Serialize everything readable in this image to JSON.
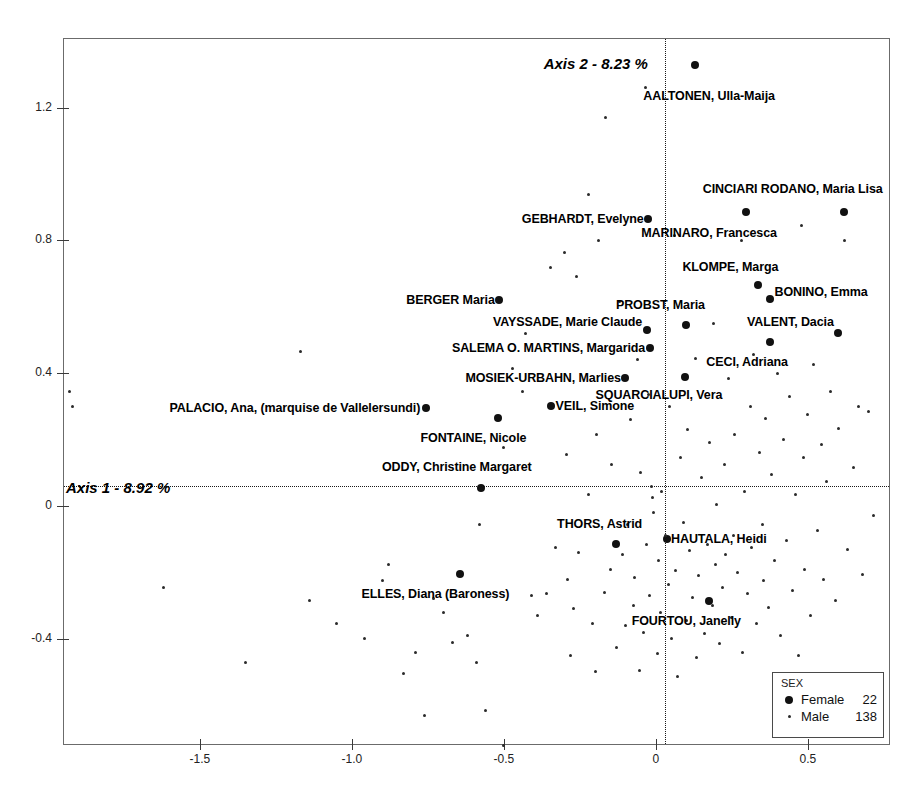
{
  "chart_data": {
    "type": "scatter",
    "title": "",
    "xlabel": "Axis 1 - 8.92 %",
    "ylabel": "Axis 2 - 8.23 %",
    "xlim": [
      -1.95,
      0.77
    ],
    "ylim": [
      -0.72,
      1.41
    ],
    "grid": false,
    "reference_lines": {
      "x": 0,
      "y": 0,
      "style": "dotted"
    },
    "xticks": [
      "-1.5",
      "-1.0",
      "-0.5",
      "0",
      "0.5"
    ],
    "xtick_values": [
      -1.5,
      -1.0,
      -0.5,
      0,
      0.5
    ],
    "yticks": [
      "1.2",
      "0.8",
      "0.4",
      "0",
      "-0.4"
    ],
    "ytick_values": [
      1.2,
      0.8,
      0.4,
      0,
      -0.4
    ],
    "legend": {
      "position": "bottom-right",
      "title": "SEX",
      "entries": [
        {
          "label": "Female",
          "count": "22",
          "marker": "large-dot"
        },
        {
          "label": "Male",
          "count": "138",
          "marker": "small-dot"
        }
      ]
    },
    "series": [
      {
        "name": "Female",
        "marker": "large-dot",
        "points": [
          {
            "label": "AALTONEN, Ulla-Maija",
            "x": 0.13,
            "y": 1.33,
            "anchor": "below",
            "lx": 0.175,
            "ly": 1.255
          },
          {
            "label": "CINCIARI RODANO, Maria Lisa",
            "x": 0.62,
            "y": 0.885,
            "anchor": "above",
            "lx": 0.45,
            "ly": 0.935
          },
          {
            "label": "MARINARO, Francesca",
            "x": 0.295,
            "y": 0.885,
            "anchor": "below",
            "lx": 0.175,
            "ly": 0.845
          },
          {
            "label": "GEBHARDT, Evelyne",
            "x": -0.025,
            "y": 0.865,
            "anchor": "left",
            "lx": -0.04,
            "ly": 0.865
          },
          {
            "label": "KLOMPE, Marga",
            "x": 0.335,
            "y": 0.665,
            "anchor": "above",
            "lx": 0.245,
            "ly": 0.7
          },
          {
            "label": "BONINO, Emma",
            "x": 0.375,
            "y": 0.625,
            "anchor": "right",
            "lx": 0.39,
            "ly": 0.645
          },
          {
            "label": "BERGER Maria",
            "x": -0.515,
            "y": 0.62,
            "anchor": "left",
            "lx": -0.53,
            "ly": 0.62
          },
          {
            "label": "PROBST, Maria",
            "x": 0.1,
            "y": 0.545,
            "anchor": "above",
            "lx": 0.015,
            "ly": 0.585
          },
          {
            "label": "VAYSSADE, Marie Claude",
            "x": -0.03,
            "y": 0.53,
            "anchor": "left",
            "lx": -0.045,
            "ly": 0.555
          },
          {
            "label": "VALENT, Dacia",
            "x": 0.6,
            "y": 0.52,
            "anchor": "left",
            "lx": 0.585,
            "ly": 0.555
          },
          {
            "label": "CECI, Adriana",
            "x": 0.375,
            "y": 0.495,
            "anchor": "below",
            "lx": 0.3,
            "ly": 0.455
          },
          {
            "label": "SALEMA O. MARTINS, Margarida",
            "x": -0.02,
            "y": 0.475,
            "anchor": "left",
            "lx": -0.035,
            "ly": 0.475
          },
          {
            "label": "SQUARCIALUPI, Vera",
            "x": 0.095,
            "y": 0.39,
            "anchor": "below",
            "lx": 0.01,
            "ly": 0.355
          },
          {
            "label": "MOSIEK-URBAHN, Marlies",
            "x": -0.1,
            "y": 0.385,
            "anchor": "left",
            "lx": -0.115,
            "ly": 0.385
          },
          {
            "label": "VEIL, Simone",
            "x": -0.345,
            "y": 0.3,
            "anchor": "right",
            "lx": -0.33,
            "ly": 0.3
          },
          {
            "label": "PALACIO, Ana, (marquise de Vallelersundi)",
            "x": -0.755,
            "y": 0.295,
            "anchor": "left",
            "lx": -0.775,
            "ly": 0.295
          },
          {
            "label": "FONTAINE, Nicole",
            "x": -0.52,
            "y": 0.265,
            "anchor": "below",
            "lx": -0.6,
            "ly": 0.225
          },
          {
            "label": "ODDY, Christine Margaret",
            "x": -0.575,
            "y": 0.055,
            "anchor": "above",
            "lx": -0.655,
            "ly": 0.095
          },
          {
            "label": "HAUTALA, Heidi",
            "x": 0.035,
            "y": -0.1,
            "anchor": "right",
            "lx": 0.05,
            "ly": -0.1
          },
          {
            "label": "THORS, Astrid",
            "x": -0.13,
            "y": -0.115,
            "anchor": "above",
            "lx": -0.185,
            "ly": -0.075
          },
          {
            "label": "ELLES, Diana (Baroness)",
            "x": -0.645,
            "y": -0.205,
            "anchor": "below",
            "lx": -0.725,
            "ly": -0.245
          },
          {
            "label": "FOURTOU, Janelly",
            "x": 0.175,
            "y": -0.285,
            "anchor": "below",
            "lx": 0.1,
            "ly": -0.325
          }
        ]
      },
      {
        "name": "Male",
        "marker": "small-dot",
        "points": [
          {
            "x": -1.93,
            "y": 0.345
          },
          {
            "x": -1.92,
            "y": 0.3
          },
          {
            "x": -1.35,
            "y": -0.47
          },
          {
            "x": -1.62,
            "y": -0.245
          },
          {
            "x": -1.17,
            "y": 0.465
          },
          {
            "x": -1.14,
            "y": -0.285
          },
          {
            "x": -1.05,
            "y": -0.355
          },
          {
            "x": -0.96,
            "y": -0.4
          },
          {
            "x": -0.9,
            "y": -0.225
          },
          {
            "x": -0.88,
            "y": -0.175
          },
          {
            "x": -0.83,
            "y": -0.505
          },
          {
            "x": -0.79,
            "y": -0.44
          },
          {
            "x": -0.76,
            "y": -0.63
          },
          {
            "x": -0.73,
            "y": -0.28
          },
          {
            "x": -0.7,
            "y": -0.32
          },
          {
            "x": -0.67,
            "y": -0.41
          },
          {
            "x": -0.62,
            "y": -0.39
          },
          {
            "x": -0.59,
            "y": -0.47
          },
          {
            "x": -0.58,
            "y": -0.055
          },
          {
            "x": -0.56,
            "y": -0.615
          },
          {
            "x": -0.5,
            "y": 0.175
          },
          {
            "x": -0.5,
            "y": -0.72
          },
          {
            "x": -0.47,
            "y": 0.415
          },
          {
            "x": -0.44,
            "y": 0.345
          },
          {
            "x": -0.43,
            "y": 0.52
          },
          {
            "x": -0.41,
            "y": -0.27
          },
          {
            "x": -0.39,
            "y": -0.33
          },
          {
            "x": -0.36,
            "y": -0.265
          },
          {
            "x": -0.345,
            "y": 0.72
          },
          {
            "x": -0.33,
            "y": -0.125
          },
          {
            "x": -0.3,
            "y": 0.765
          },
          {
            "x": -0.295,
            "y": 0.155
          },
          {
            "x": -0.29,
            "y": -0.22
          },
          {
            "x": -0.28,
            "y": -0.45
          },
          {
            "x": -0.27,
            "y": -0.31
          },
          {
            "x": -0.26,
            "y": 0.69
          },
          {
            "x": -0.255,
            "y": -0.14
          },
          {
            "x": -0.22,
            "y": 0.94
          },
          {
            "x": -0.22,
            "y": 0.035
          },
          {
            "x": -0.21,
            "y": -0.355
          },
          {
            "x": -0.2,
            "y": -0.5
          },
          {
            "x": -0.195,
            "y": 0.215
          },
          {
            "x": -0.19,
            "y": 0.8
          },
          {
            "x": -0.17,
            "y": -0.26
          },
          {
            "x": -0.165,
            "y": 1.17
          },
          {
            "x": -0.15,
            "y": -0.19
          },
          {
            "x": -0.145,
            "y": 0.125
          },
          {
            "x": -0.13,
            "y": -0.425
          },
          {
            "x": -0.12,
            "y": 0.615
          },
          {
            "x": -0.11,
            "y": -0.145
          },
          {
            "x": -0.1,
            "y": -0.36
          },
          {
            "x": -0.095,
            "y": -0.055
          },
          {
            "x": -0.085,
            "y": 0.26
          },
          {
            "x": -0.075,
            "y": -0.3
          },
          {
            "x": -0.07,
            "y": -0.215
          },
          {
            "x": -0.06,
            "y": 0.44
          },
          {
            "x": -0.055,
            "y": -0.495
          },
          {
            "x": -0.05,
            "y": 0.1
          },
          {
            "x": -0.04,
            "y": -0.38
          },
          {
            "x": -0.035,
            "y": 1.26
          },
          {
            "x": -0.03,
            "y": -0.115
          },
          {
            "x": -0.025,
            "y": 0.335
          },
          {
            "x": -0.02,
            "y": -0.27
          },
          {
            "x": -0.015,
            "y": 0.06
          },
          {
            "x": -0.01,
            "y": 0.025
          },
          {
            "x": -0.008,
            "y": -0.02
          },
          {
            "x": 0.005,
            "y": -0.445
          },
          {
            "x": 0.01,
            "y": -0.165
          },
          {
            "x": 0.015,
            "y": -0.32
          },
          {
            "x": 0.02,
            "y": 0.045
          },
          {
            "x": 0.03,
            "y": -0.09
          },
          {
            "x": 0.04,
            "y": -0.235
          },
          {
            "x": 0.045,
            "y": 0.3
          },
          {
            "x": 0.05,
            "y": -0.4
          },
          {
            "x": 0.06,
            "y": 0.815
          },
          {
            "x": 0.065,
            "y": -0.195
          },
          {
            "x": 0.07,
            "y": -0.515
          },
          {
            "x": 0.08,
            "y": 0.145
          },
          {
            "x": 0.09,
            "y": -0.05
          },
          {
            "x": 0.1,
            "y": -0.345
          },
          {
            "x": 0.105,
            "y": 0.23
          },
          {
            "x": 0.11,
            "y": -0.135
          },
          {
            "x": 0.12,
            "y": -0.275
          },
          {
            "x": 0.13,
            "y": 0.445
          },
          {
            "x": 0.135,
            "y": -0.455
          },
          {
            "x": 0.14,
            "y": -0.21
          },
          {
            "x": 0.15,
            "y": 0.085
          },
          {
            "x": 0.16,
            "y": -0.385
          },
          {
            "x": 0.17,
            "y": -0.115
          },
          {
            "x": 0.175,
            "y": 0.19
          },
          {
            "x": 0.185,
            "y": -0.3
          },
          {
            "x": 0.19,
            "y": 0.55
          },
          {
            "x": 0.195,
            "y": -0.175
          },
          {
            "x": 0.2,
            "y": 0.005
          },
          {
            "x": 0.21,
            "y": -0.415
          },
          {
            "x": 0.22,
            "y": -0.245
          },
          {
            "x": 0.225,
            "y": 0.125
          },
          {
            "x": 0.23,
            "y": -0.145
          },
          {
            "x": 0.24,
            "y": 0.385
          },
          {
            "x": 0.25,
            "y": -0.335
          },
          {
            "x": 0.255,
            "y": -0.09
          },
          {
            "x": 0.26,
            "y": 0.215
          },
          {
            "x": 0.27,
            "y": -0.2
          },
          {
            "x": 0.28,
            "y": 0.8
          },
          {
            "x": 0.285,
            "y": -0.44
          },
          {
            "x": 0.29,
            "y": 0.045
          },
          {
            "x": 0.3,
            "y": -0.265
          },
          {
            "x": 0.31,
            "y": 0.3
          },
          {
            "x": 0.315,
            "y": -0.125
          },
          {
            "x": 0.32,
            "y": 0.455
          },
          {
            "x": 0.33,
            "y": -0.355
          },
          {
            "x": 0.34,
            "y": 0.16
          },
          {
            "x": 0.35,
            "y": -0.055
          },
          {
            "x": 0.355,
            "y": -0.225
          },
          {
            "x": 0.36,
            "y": 0.265
          },
          {
            "x": 0.37,
            "y": -0.305
          },
          {
            "x": 0.38,
            "y": 0.095
          },
          {
            "x": 0.39,
            "y": -0.165
          },
          {
            "x": 0.4,
            "y": 0.4
          },
          {
            "x": 0.41,
            "y": -0.39
          },
          {
            "x": 0.42,
            "y": 0.2
          },
          {
            "x": 0.43,
            "y": -0.105
          },
          {
            "x": 0.44,
            "y": 0.33
          },
          {
            "x": 0.45,
            "y": -0.255
          },
          {
            "x": 0.46,
            "y": 0.035
          },
          {
            "x": 0.47,
            "y": -0.45
          },
          {
            "x": 0.48,
            "y": 0.845
          },
          {
            "x": 0.485,
            "y": 0.145
          },
          {
            "x": 0.49,
            "y": -0.19
          },
          {
            "x": 0.5,
            "y": 0.275
          },
          {
            "x": 0.51,
            "y": -0.33
          },
          {
            "x": 0.52,
            "y": 0.425
          },
          {
            "x": 0.53,
            "y": -0.075
          },
          {
            "x": 0.545,
            "y": 0.185
          },
          {
            "x": 0.55,
            "y": -0.22
          },
          {
            "x": 0.56,
            "y": 0.075
          },
          {
            "x": 0.575,
            "y": 0.345
          },
          {
            "x": 0.59,
            "y": -0.285
          },
          {
            "x": 0.6,
            "y": 0.235
          },
          {
            "x": 0.62,
            "y": 0.8
          },
          {
            "x": 0.63,
            "y": -0.13
          },
          {
            "x": 0.65,
            "y": 0.115
          },
          {
            "x": 0.665,
            "y": 0.3
          },
          {
            "x": 0.68,
            "y": -0.205
          },
          {
            "x": 0.7,
            "y": 0.285
          },
          {
            "x": 0.715,
            "y": -0.03
          }
        ]
      }
    ]
  }
}
